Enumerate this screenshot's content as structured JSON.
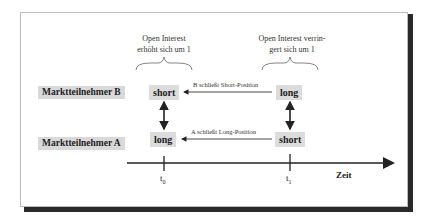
{
  "participants": {
    "b": {
      "label": "Marktteilnehmer B",
      "t0_position": "short",
      "t1_position": "long"
    },
    "a": {
      "label": "Marktteilnehmer A",
      "t0_position": "long",
      "t1_position": "short"
    }
  },
  "annotations": {
    "t0_note_line1": "Open Interest",
    "t0_note_line2": "erhöht sich um 1",
    "t1_note_line1": "Open Interest verrin-",
    "t1_note_line2": "gert sich um 1"
  },
  "transitions": {
    "b_label": "B schließt Short-Position",
    "a_label": "A schließt Long-Position"
  },
  "axis": {
    "label": "Zeit",
    "ticks": [
      {
        "base": "t",
        "sub": "0"
      },
      {
        "base": "t",
        "sub": "1"
      }
    ]
  }
}
